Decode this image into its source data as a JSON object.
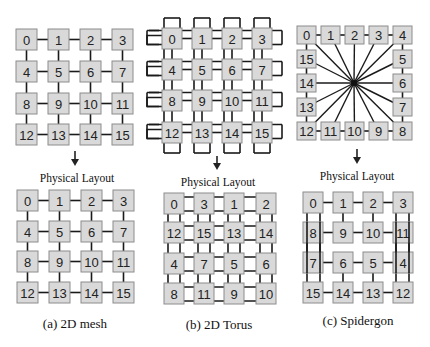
{
  "figure": {
    "panels": [
      {
        "id": "mesh",
        "caption": "(a) 2D mesh",
        "layout_label": "Physical Layout",
        "logical_grid": [
          [
            0,
            1,
            2,
            3
          ],
          [
            4,
            5,
            6,
            7
          ],
          [
            8,
            9,
            10,
            11
          ],
          [
            12,
            13,
            14,
            15
          ]
        ],
        "physical_grid": [
          [
            0,
            1,
            2,
            3
          ],
          [
            4,
            5,
            6,
            7
          ],
          [
            8,
            9,
            10,
            11
          ],
          [
            12,
            13,
            14,
            15
          ]
        ]
      },
      {
        "id": "torus",
        "caption": "(b) 2D Torus",
        "layout_label": "Physical Layout",
        "logical_grid": [
          [
            0,
            1,
            2,
            3
          ],
          [
            4,
            5,
            6,
            7
          ],
          [
            8,
            9,
            10,
            11
          ],
          [
            12,
            13,
            14,
            15
          ]
        ],
        "physical_grid": [
          [
            0,
            3,
            1,
            2
          ],
          [
            12,
            15,
            13,
            14
          ],
          [
            4,
            7,
            5,
            6
          ],
          [
            8,
            11,
            9,
            10
          ]
        ]
      },
      {
        "id": "spidergon",
        "caption": "(c) Spidergon",
        "layout_label": "Physical Layout",
        "logical_ring": [
          0,
          1,
          2,
          3,
          4,
          5,
          6,
          7,
          8,
          9,
          10,
          11,
          12,
          13,
          14,
          15
        ],
        "physical_grid": [
          [
            0,
            1,
            2,
            3
          ],
          [
            8,
            9,
            10,
            11
          ],
          [
            7,
            6,
            5,
            4
          ],
          [
            15,
            14,
            13,
            12
          ]
        ]
      }
    ]
  },
  "colors": {
    "node_fill": "#d9d9d9",
    "node_stroke": "#8c8c8c",
    "link": "#1a1a1a",
    "text": "#222222"
  }
}
